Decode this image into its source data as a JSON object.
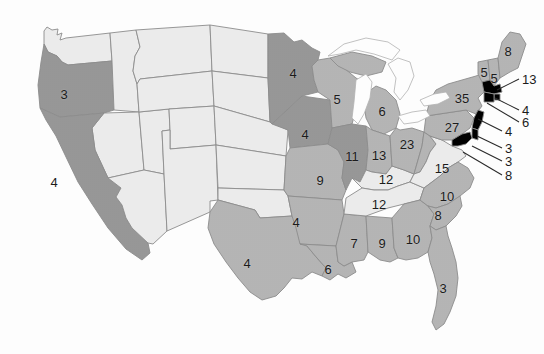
{
  "figure": {
    "kind": "choropleth-map",
    "region": "United States (contiguous 48 states)",
    "title": "",
    "subtitle": "",
    "legend_shown": false,
    "background_color": "#ffffff",
    "border_color": "#8d8d8d",
    "label_color": "#1c1c1c",
    "lake_color": "#ffffff"
  },
  "shade_scale": {
    "light": "#ededed",
    "medium": "#b6b6b6",
    "dark": "#989898"
  },
  "chart_data": {
    "type": "heatmap",
    "title": "",
    "xlabel": "",
    "ylabel": "",
    "grid": false,
    "legend_position": "none",
    "value_range": [
      3,
      35
    ],
    "states": [
      {
        "code": "WA",
        "name": "Washington",
        "value": null,
        "shade": "light",
        "label": "",
        "x": 62,
        "y": 55
      },
      {
        "code": "OR",
        "name": "Oregon",
        "value": 3,
        "shade": "dark",
        "label": "3",
        "x": 64,
        "y": 94
      },
      {
        "code": "CA",
        "name": "California",
        "value": 4,
        "shade": "dark",
        "label": "4",
        "x": 54,
        "y": 182
      },
      {
        "code": "ID",
        "name": "Idaho",
        "value": null,
        "shade": "light",
        "label": "",
        "x": 118,
        "y": 92
      },
      {
        "code": "NV",
        "name": "Nevada",
        "value": null,
        "shade": "light",
        "label": "",
        "x": 96,
        "y": 152
      },
      {
        "code": "UT",
        "name": "Utah",
        "value": null,
        "shade": "light",
        "label": "",
        "x": 136,
        "y": 155
      },
      {
        "code": "AZ",
        "name": "Arizona",
        "value": null,
        "shade": "light",
        "label": "",
        "x": 130,
        "y": 216
      },
      {
        "code": "MT",
        "name": "Montana",
        "value": null,
        "shade": "light",
        "label": "",
        "x": 168,
        "y": 66
      },
      {
        "code": "WY",
        "name": "Wyoming",
        "value": null,
        "shade": "light",
        "label": "",
        "x": 170,
        "y": 117
      },
      {
        "code": "CO",
        "name": "Colorado",
        "value": null,
        "shade": "light",
        "label": "",
        "x": 178,
        "y": 163
      },
      {
        "code": "NM",
        "name": "New Mexico",
        "value": null,
        "shade": "light",
        "label": "",
        "x": 184,
        "y": 222
      },
      {
        "code": "ND",
        "name": "North Dakota",
        "value": null,
        "shade": "light",
        "label": "",
        "x": 232,
        "y": 64
      },
      {
        "code": "SD",
        "name": "South Dakota",
        "value": null,
        "shade": "light",
        "label": "",
        "x": 234,
        "y": 104
      },
      {
        "code": "NE",
        "name": "Nebraska",
        "value": null,
        "shade": "light",
        "label": "",
        "x": 238,
        "y": 140
      },
      {
        "code": "KS",
        "name": "Kansas",
        "value": null,
        "shade": "light",
        "label": "",
        "x": 246,
        "y": 172
      },
      {
        "code": "OK",
        "name": "Oklahoma",
        "value": null,
        "shade": "light",
        "label": "",
        "x": 252,
        "y": 205
      },
      {
        "code": "TX",
        "name": "Texas",
        "value": 4,
        "shade": "medium",
        "label": "4",
        "x": 247,
        "y": 263
      },
      {
        "code": "MN",
        "name": "Minnesota",
        "value": 4,
        "shade": "dark",
        "label": "4",
        "x": 293,
        "y": 73
      },
      {
        "code": "IA",
        "name": "Iowa",
        "value": 4,
        "shade": "dark",
        "label": "4",
        "x": 305,
        "y": 134
      },
      {
        "code": "MO",
        "name": "Missouri",
        "value": 9,
        "shade": "medium",
        "label": "9",
        "x": 320,
        "y": 180
      },
      {
        "code": "AR",
        "name": "Arkansas",
        "value": 4,
        "shade": "medium",
        "label": "4",
        "x": 296,
        "y": 222
      },
      {
        "code": "LA",
        "name": "Louisiana",
        "value": 6,
        "shade": "medium",
        "label": "6",
        "x": 328,
        "y": 269
      },
      {
        "code": "WI",
        "name": "Wisconsin",
        "value": 5,
        "shade": "medium",
        "label": "5",
        "x": 337,
        "y": 99
      },
      {
        "code": "IL",
        "name": "Illinois",
        "value": 11,
        "shade": "dark",
        "label": "11",
        "x": 352,
        "y": 156
      },
      {
        "code": "MS",
        "name": "Mississippi",
        "value": 7,
        "shade": "medium",
        "label": "7",
        "x": 354,
        "y": 243
      },
      {
        "code": "MI",
        "name": "Michigan",
        "value": 6,
        "shade": "medium",
        "label": "6",
        "x": 382,
        "y": 111
      },
      {
        "code": "IN",
        "name": "Indiana",
        "value": 13,
        "shade": "medium",
        "label": "13",
        "x": 379,
        "y": 155
      },
      {
        "code": "AL",
        "name": "Alabama",
        "value": 9,
        "shade": "medium",
        "label": "9",
        "x": 382,
        "y": 243
      },
      {
        "code": "KY",
        "name": "Kentucky",
        "value": 12,
        "shade": "light",
        "label": "12",
        "x": 386,
        "y": 179
      },
      {
        "code": "TN",
        "name": "Tennessee",
        "value": 12,
        "shade": "light",
        "label": "12",
        "x": 379,
        "y": 204
      },
      {
        "code": "OH",
        "name": "Ohio",
        "value": 23,
        "shade": "medium",
        "label": "23",
        "x": 407,
        "y": 144
      },
      {
        "code": "GA",
        "name": "Georgia",
        "value": 10,
        "shade": "medium",
        "label": "10",
        "x": 413,
        "y": 239
      },
      {
        "code": "WV",
        "name": "West Virginia",
        "value": null,
        "shade": "medium",
        "label": "",
        "x": 421,
        "y": 163
      },
      {
        "code": "VA",
        "name": "Virginia",
        "value": 15,
        "shade": "light",
        "label": "15",
        "x": 442,
        "y": 168
      },
      {
        "code": "NC",
        "name": "North Carolina",
        "value": 10,
        "shade": "medium",
        "label": "10",
        "x": 447,
        "y": 196
      },
      {
        "code": "SC",
        "name": "South Carolina",
        "value": 8,
        "shade": "medium",
        "label": "8",
        "x": 438,
        "y": 215
      },
      {
        "code": "FL",
        "name": "Florida",
        "value": 3,
        "shade": "medium",
        "label": "3",
        "x": 443,
        "y": 288
      },
      {
        "code": "PA",
        "name": "Pennsylvania",
        "value": 27,
        "shade": "medium",
        "label": "27",
        "x": 452,
        "y": 127
      },
      {
        "code": "NY",
        "name": "New York",
        "value": 35,
        "shade": "medium",
        "label": "35",
        "x": 462,
        "y": 98
      },
      {
        "code": "VT",
        "name": "Vermont",
        "value": 5,
        "shade": "medium",
        "label": "5",
        "x": 484,
        "y": 72
      },
      {
        "code": "NH",
        "name": "New Hampshire",
        "value": 5,
        "shade": "medium",
        "label": "5",
        "x": 494,
        "y": 78
      },
      {
        "code": "ME",
        "name": "Maine",
        "value": 8,
        "shade": "medium",
        "label": "8",
        "x": 508,
        "y": 51
      }
    ],
    "callouts": [
      {
        "code": "MA",
        "name": "Massachusetts",
        "value": 13,
        "label": "13",
        "label_x": 522,
        "label_y": 79,
        "line": [
          [
            519,
            79
          ],
          [
            497,
            90
          ]
        ]
      },
      {
        "code": "RI",
        "name": "Rhode Island",
        "value": 4,
        "label": "4",
        "label_x": 522,
        "label_y": 110,
        "line": [
          [
            519,
            110
          ],
          [
            495,
            98
          ]
        ]
      },
      {
        "code": "CT",
        "name": "Connecticut",
        "value": 6,
        "label": "6",
        "label_x": 522,
        "label_y": 122,
        "line": [
          [
            519,
            122
          ],
          [
            487,
            103
          ]
        ]
      },
      {
        "code": "NJ",
        "name": "New Jersey",
        "value": 4,
        "label": "4",
        "label_x": 505,
        "label_y": 131,
        "line": [
          [
            502,
            131
          ],
          [
            478,
            119
          ]
        ]
      },
      {
        "code": "DE",
        "name": "Delaware",
        "value": 3,
        "label": "3",
        "label_x": 505,
        "label_y": 148,
        "line": [
          [
            502,
            148
          ],
          [
            477,
            136
          ]
        ]
      },
      {
        "code": "MD",
        "name": "Maryland",
        "value": 3,
        "label": "3",
        "label_x": 505,
        "label_y": 161,
        "line": [
          [
            502,
            161
          ],
          [
            472,
            146
          ]
        ]
      },
      {
        "code": "DC",
        "name": "District of Columbia",
        "value": 8,
        "label": "8",
        "label_x": 505,
        "label_y": 175,
        "line": [
          [
            502,
            175
          ],
          [
            463,
            152
          ]
        ]
      }
    ]
  }
}
